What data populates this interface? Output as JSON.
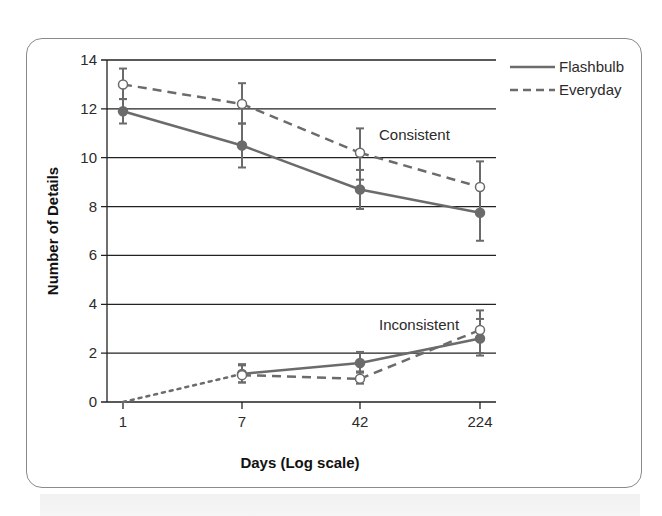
{
  "chart_data": {
    "type": "line",
    "title": "",
    "xlabel": "Days (Log scale)",
    "ylabel": "Number of Details",
    "x_scale": "log (categorical spacing)",
    "categories": [
      "1",
      "7",
      "42",
      "224"
    ],
    "yticks": [
      "0",
      "2",
      "4",
      "6",
      "8",
      "10",
      "12",
      "14"
    ],
    "ylim": [
      0,
      14
    ],
    "grid": "horizontal",
    "legend_position": "top-right outside plot",
    "legend": [
      {
        "label": "Flashbulb",
        "style": "solid"
      },
      {
        "label": "Everyday",
        "style": "dashed"
      }
    ],
    "annotations": [
      {
        "text": "Consistent",
        "near": "x=42, y≈10.8"
      },
      {
        "text": "Inconsistent",
        "near": "x=42..224, y≈3.2"
      }
    ],
    "series": [
      {
        "name": "Flashbulb Consistent",
        "style": "solid",
        "marker": "filled-circle",
        "x": [
          "1",
          "7",
          "42",
          "224"
        ],
        "values": [
          11.9,
          10.5,
          8.7,
          7.75
        ],
        "error_low": [
          11.4,
          9.6,
          7.9,
          6.6
        ],
        "error_high": [
          12.4,
          11.4,
          9.5,
          8.9
        ]
      },
      {
        "name": "Everyday Consistent",
        "style": "dashed",
        "marker": "open-circle",
        "x": [
          "1",
          "7",
          "42",
          "224"
        ],
        "values": [
          13.0,
          12.2,
          10.2,
          8.8
        ],
        "error_low": [
          12.4,
          11.4,
          9.1,
          7.7
        ],
        "error_high": [
          13.65,
          13.05,
          11.2,
          9.85
        ]
      },
      {
        "name": "Flashbulb Inconsistent",
        "style": "solid",
        "marker": "filled-circle",
        "x": [
          "1",
          "7",
          "42",
          "224"
        ],
        "values": [
          0,
          1.15,
          1.6,
          2.6
        ],
        "error_low": [
          null,
          0.8,
          1.2,
          1.9
        ],
        "error_high": [
          null,
          1.5,
          2.05,
          3.4
        ],
        "note": "segment from day 1 to day 7 drawn dotted"
      },
      {
        "name": "Everyday Inconsistent",
        "style": "dashed",
        "marker": "open-circle",
        "x": [
          "1",
          "7",
          "42",
          "224"
        ],
        "values": [
          0,
          1.1,
          0.95,
          2.95
        ],
        "error_low": [
          null,
          0.8,
          0.75,
          2.0
        ],
        "error_high": [
          null,
          1.55,
          1.25,
          3.75
        ]
      }
    ]
  },
  "labels": {
    "xlabel": "Days (Log scale)",
    "ylabel": "Number of Details",
    "consistent": "Consistent",
    "inconsistent": "Inconsistent",
    "legend_flashbulb": "Flashbulb",
    "legend_everyday": "Everyday"
  },
  "colors": {
    "series_line": "#6b6b6b",
    "gridline": "#222222",
    "frame": "#8a8a8a"
  }
}
